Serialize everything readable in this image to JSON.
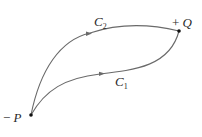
{
  "diagram": {
    "points": {
      "P": {
        "sign": "−",
        "name": "P"
      },
      "Q": {
        "sign": "+",
        "name": "Q"
      }
    },
    "curves": {
      "C1": {
        "letter": "C",
        "subscript": "1"
      },
      "C2": {
        "letter": "C",
        "subscript": "2"
      }
    },
    "colors": {
      "curve": "#6a6a6a",
      "point": "#111111",
      "text": "#2a2a2a"
    }
  }
}
